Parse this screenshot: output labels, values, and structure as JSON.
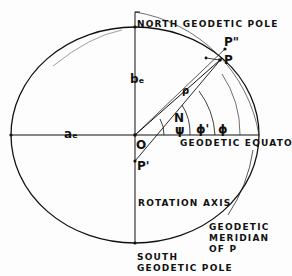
{
  "diagram": {
    "labels": {
      "north_pole": "NORTH GEODETIC POLE",
      "south_pole": "SOUTH\nGEODETIC POLE",
      "equator": "GEODETIC EQUATOR",
      "rotation_axis": "ROTATION AXIS",
      "meridian": "GEODETIC\nMERIDIAN\nOF P",
      "semi_major": "aₑ",
      "semi_minor": "bₑ",
      "origin": "O",
      "point_p": "P",
      "point_p_double_prime": "P\"",
      "point_p_prime": "P'",
      "rho": "ρ",
      "normal": "N",
      "psi": "ψ",
      "phi_prime": "ϕ'",
      "phi": "ϕ"
    }
  }
}
